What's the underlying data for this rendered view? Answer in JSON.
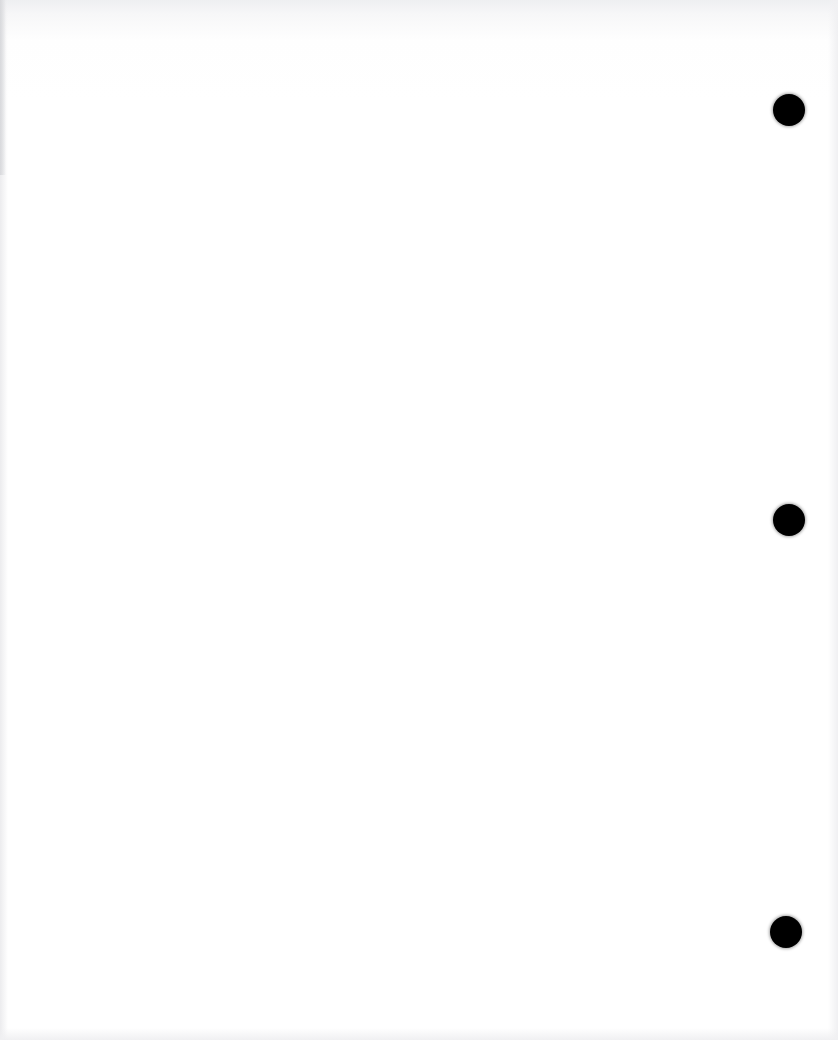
{
  "document": {
    "type": "blank scanned page",
    "background_color": "#ffffff",
    "bleed_through": {
      "legible": false,
      "lines": [
        "",
        "",
        "",
        ""
      ]
    },
    "punch_holes": [
      {
        "name": "top",
        "cx": 789,
        "cy": 110
      },
      {
        "name": "middle",
        "cx": 789,
        "cy": 520
      },
      {
        "name": "bottom",
        "cx": 786,
        "cy": 932
      }
    ],
    "hole_color": "#000000"
  }
}
